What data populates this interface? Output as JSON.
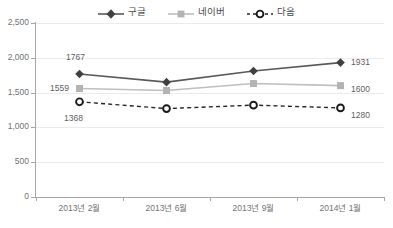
{
  "chart_data": {
    "type": "line",
    "title": "",
    "xlabel": "",
    "ylabel": "",
    "categories": [
      "2013년 2월",
      "2013년 6월",
      "2013년 9월",
      "2014년 1월"
    ],
    "ylim": [
      0,
      2500
    ],
    "yticks": [
      0,
      500,
      1000,
      1500,
      2000,
      2500
    ],
    "ytick_labels": [
      "0",
      "500",
      "1,000",
      "1,500",
      "2,000",
      "2,500"
    ],
    "grid": true,
    "legend_position": "top-center",
    "series": [
      {
        "name": "구글",
        "values": [
          1767,
          1650,
          1810,
          1931
        ],
        "color": "#595959",
        "marker": "diamond",
        "line_style": "solid",
        "labels": {
          "0": "1767",
          "3": "1931"
        }
      },
      {
        "name": "네이버",
        "values": [
          1559,
          1530,
          1630,
          1600
        ],
        "color": "#bfbfbf",
        "marker": "square",
        "line_style": "solid",
        "labels": {
          "0": "1559",
          "3": "1600"
        }
      },
      {
        "name": "다음",
        "values": [
          1368,
          1270,
          1320,
          1280
        ],
        "color": "#262626",
        "marker": "circle-open",
        "line_style": "dashed",
        "labels": {
          "0": "1368",
          "3": "1280"
        }
      }
    ]
  },
  "legend": {
    "items": [
      {
        "label": "구글",
        "marker": "diamond-marker",
        "color": "#595959"
      },
      {
        "label": "네이버",
        "marker": "square-marker",
        "color": "#bfbfbf"
      },
      {
        "label": "다음",
        "marker": "circle-open-marker",
        "color": "#262626"
      }
    ]
  },
  "axes": {
    "y_labels": [
      "2,500",
      "2,000",
      "1,500",
      "1,000",
      "500",
      "0"
    ],
    "x_labels": [
      "2013년 2월",
      "2013년 6월",
      "2013년 9월",
      "2014년 1월"
    ]
  },
  "data_labels": {
    "google_first": "1767",
    "google_last": "1931",
    "naver_first": "1559",
    "naver_last": "1600",
    "daum_first": "1368",
    "daum_last": "1280"
  }
}
